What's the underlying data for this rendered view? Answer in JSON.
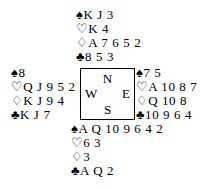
{
  "diagram": {
    "type": "bridge-deal-diagram",
    "background_color": "#ffffff",
    "text_color": "#000000",
    "suit_symbols": {
      "spade": "♠",
      "heart": "♡",
      "diamond": "♢",
      "club": "♣"
    },
    "compass": {
      "north": "N",
      "west": "W",
      "east": "E",
      "south": "S"
    },
    "hands": {
      "north": {
        "label": "North",
        "spades": "K J 3",
        "hearts": "K 4",
        "diamonds": "A 7 6 5 2",
        "clubs": "8 5 3"
      },
      "west": {
        "label": "West",
        "spades": "8",
        "hearts": "Q J 9 5 2",
        "diamonds": "K J 9 4",
        "clubs": "K J 7"
      },
      "east": {
        "label": "East",
        "spades": "7 5",
        "hearts": "A 10 8 7",
        "diamonds": "Q 10 8",
        "clubs": "10 9 6 4"
      },
      "south": {
        "label": "South",
        "spades": "A Q 10 9 6 4 2",
        "hearts": "6 3",
        "diamonds": "3",
        "clubs": "A Q 2"
      }
    }
  }
}
